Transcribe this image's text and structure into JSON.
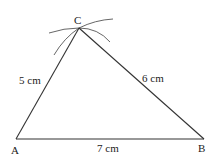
{
  "diagram": {
    "type": "triangle-construction",
    "vertices": {
      "A": {
        "label": "A",
        "x": 16,
        "y": 139
      },
      "B": {
        "label": "B",
        "x": 204,
        "y": 139
      },
      "C": {
        "label": "C",
        "x": 79,
        "y": 28
      }
    },
    "sides": {
      "AC": {
        "label": "5 cm"
      },
      "CB": {
        "label": "6 cm"
      },
      "AB": {
        "label": "7 cm"
      }
    },
    "colors": {
      "line": "#333333",
      "arc": "#555555",
      "text": "#222222"
    }
  }
}
